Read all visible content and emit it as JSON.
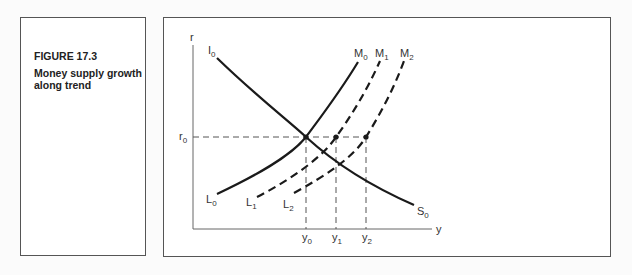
{
  "caption": {
    "label": "FIGURE 17.3",
    "title": "Money supply growth along trend"
  },
  "diagram": {
    "axes": {
      "y_label": "r",
      "x_label": "y"
    },
    "r_level": {
      "label": "r",
      "sub": "0"
    },
    "curves": {
      "I": {
        "label": "I",
        "sub": "0",
        "style": "solid"
      },
      "S": {
        "label": "S",
        "sub": "0",
        "style": "solid"
      },
      "M0": {
        "label": "M",
        "sub": "0",
        "style": "solid"
      },
      "M1": {
        "label": "M",
        "sub": "1",
        "style": "dashed"
      },
      "M2": {
        "label": "M",
        "sub": "2",
        "style": "dashed"
      },
      "L0": {
        "label": "L",
        "sub": "0",
        "style": "solid"
      },
      "L1": {
        "label": "L",
        "sub": "1",
        "style": "dashed"
      },
      "L2": {
        "label": "L",
        "sub": "2",
        "style": "dashed"
      }
    },
    "x_ticks": [
      {
        "label": "y",
        "sub": "0"
      },
      {
        "label": "y",
        "sub": "1"
      },
      {
        "label": "y",
        "sub": "2"
      }
    ],
    "colors": {
      "line": "#1a1a1a",
      "axis": "#666666",
      "border": "#555555"
    }
  }
}
